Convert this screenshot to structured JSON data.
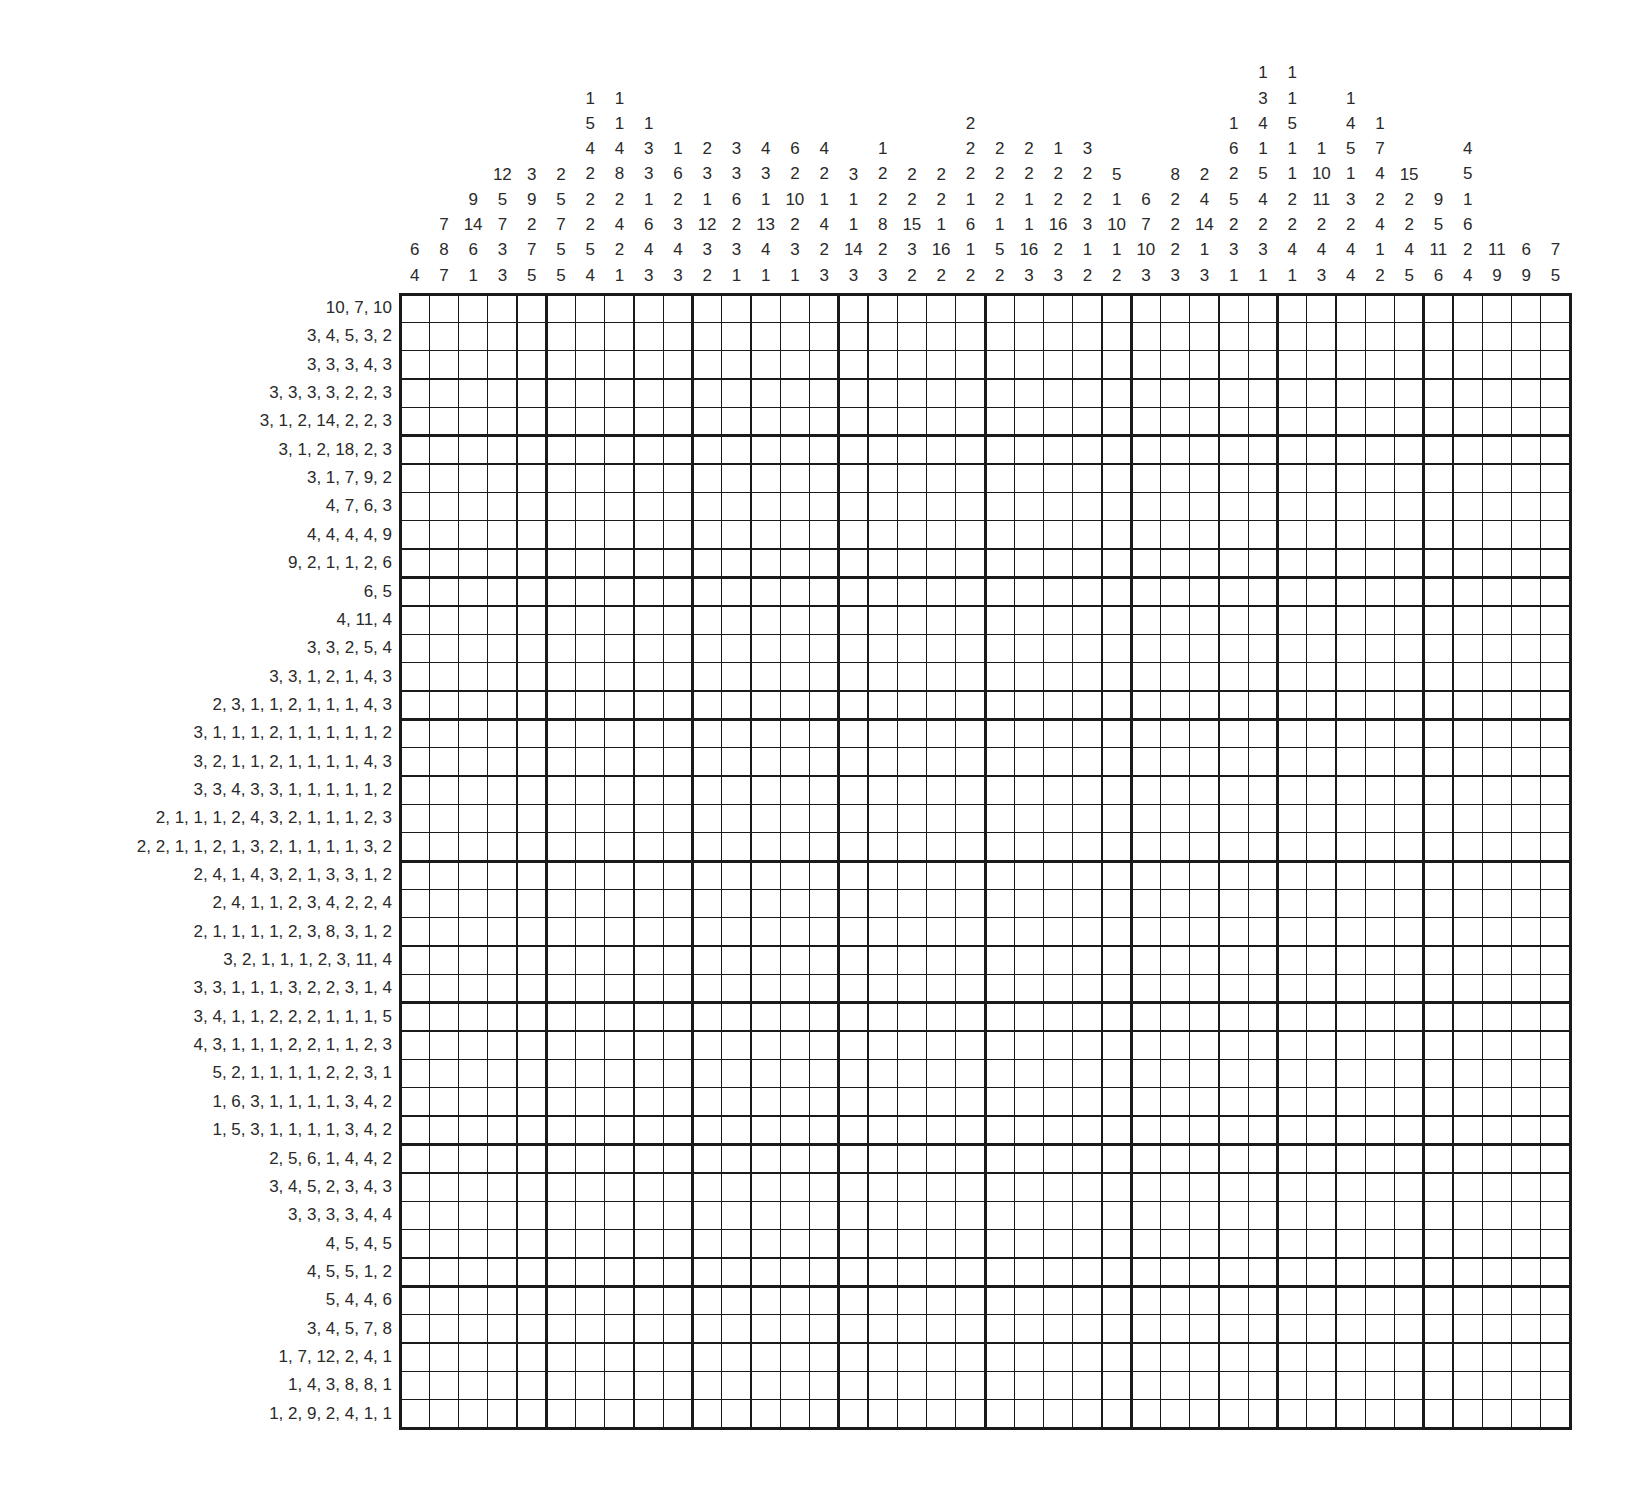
{
  "puzzle": {
    "type": "nonogram",
    "rows": 40,
    "cols": 40,
    "thick_every": 5,
    "colors": {
      "line": "#1a1a1a",
      "text": "#2a2a2a",
      "background": "#ffffff"
    },
    "column_clues": [
      [
        6,
        4
      ],
      [
        7,
        8,
        7
      ],
      [
        9,
        14,
        6,
        1
      ],
      [
        12,
        5,
        7,
        3,
        3
      ],
      [
        3,
        9,
        2,
        7,
        5
      ],
      [
        2,
        5,
        7,
        5,
        5
      ],
      [
        1,
        5,
        4,
        2,
        2,
        2,
        5,
        4
      ],
      [
        1,
        1,
        4,
        8,
        2,
        4,
        2,
        1
      ],
      [
        1,
        3,
        3,
        1,
        6,
        4,
        3
      ],
      [
        1,
        6,
        2,
        3,
        4,
        3
      ],
      [
        2,
        3,
        1,
        12,
        3,
        2
      ],
      [
        3,
        3,
        6,
        2,
        3,
        1
      ],
      [
        4,
        3,
        1,
        13,
        4,
        1
      ],
      [
        6,
        2,
        10,
        2,
        3,
        1
      ],
      [
        4,
        2,
        1,
        4,
        2,
        3
      ],
      [
        3,
        1,
        1,
        14,
        3
      ],
      [
        1,
        2,
        2,
        8,
        2,
        3
      ],
      [
        2,
        2,
        15,
        3,
        2
      ],
      [
        2,
        2,
        1,
        16,
        2
      ],
      [
        2,
        2,
        2,
        1,
        6,
        1,
        2
      ],
      [
        2,
        2,
        2,
        1,
        5,
        2
      ],
      [
        2,
        2,
        1,
        1,
        16,
        3
      ],
      [
        1,
        2,
        2,
        16,
        2,
        3
      ],
      [
        3,
        2,
        2,
        3,
        1,
        2
      ],
      [
        5,
        1,
        10,
        1,
        2
      ],
      [
        6,
        7,
        10,
        3
      ],
      [
        8,
        2,
        2,
        2,
        3
      ],
      [
        2,
        4,
        14,
        1,
        3
      ],
      [
        1,
        6,
        2,
        5,
        2,
        3,
        1
      ],
      [
        1,
        3,
        4,
        1,
        5,
        4,
        2,
        3,
        1
      ],
      [
        1,
        1,
        5,
        1,
        1,
        2,
        2,
        4,
        1
      ],
      [
        1,
        10,
        11,
        2,
        4,
        3
      ],
      [
        1,
        4,
        5,
        1,
        3,
        2,
        4,
        4
      ],
      [
        1,
        7,
        4,
        2,
        4,
        1,
        2
      ],
      [
        15,
        2,
        2,
        4,
        5
      ],
      [
        9,
        5,
        11,
        6
      ],
      [
        4,
        5,
        1,
        6,
        2,
        4
      ],
      [
        11,
        9
      ],
      [
        6,
        9
      ],
      [
        7,
        5
      ]
    ],
    "row_clues": [
      "10, 7, 10",
      "3, 4, 5, 3, 2",
      "3, 3, 3, 4, 3",
      "3, 3, 3, 3, 2, 2, 3",
      "3, 1, 2, 14, 2, 2, 3",
      "3, 1, 2, 18, 2, 3",
      "3, 1, 7, 9, 2",
      "4, 7, 6, 3",
      "4, 4, 4, 4, 9",
      "9, 2, 1, 1, 2, 6",
      "6, 5",
      "4, 11, 4",
      "3, 3, 2, 5, 4",
      "3, 3, 1, 2, 1, 4, 3",
      "2, 3, 1, 1, 2, 1, 1, 1, 4, 3",
      "3, 1, 1, 1, 2, 1, 1, 1, 1, 1, 2",
      "3, 2, 1, 1, 2, 1, 1, 1, 1, 4, 3",
      "3, 3, 4, 3, 3, 1, 1, 1, 1, 1, 2",
      "2, 1, 1, 1, 2, 4, 3, 2, 1, 1, 1, 2, 3",
      "2, 2, 1, 1, 2, 1, 3, 2, 1, 1, 1, 1, 3, 2",
      "2, 4, 1, 4, 3, 2, 1, 3, 3, 1, 2",
      "2, 4, 1, 1, 2, 3, 4, 2, 2, 4",
      "2, 1, 1, 1, 1, 2, 3, 8, 3, 1, 2",
      "3, 2, 1, 1, 1, 2, 3, 11, 4",
      "3, 3, 1, 1, 1, 3, 2, 2, 3, 1, 4",
      "3, 4, 1, 1, 2, 2, 2, 1, 1, 1, 5",
      "4, 3, 1, 1, 1, 2, 2, 1, 1, 2, 3",
      "5, 2, 1, 1, 1, 1, 2, 2, 3, 1",
      "1, 6, 3, 1, 1, 1, 1, 3, 4, 2",
      "1, 5, 3, 1, 1, 1, 1, 3, 4, 2",
      "2, 5, 6, 1, 4, 4, 2",
      "3, 4, 5, 2, 3, 4, 3",
      "3, 3, 3, 3, 4, 4",
      "4, 5, 4, 5",
      "4, 5, 5, 1, 2",
      "5, 4, 4, 6",
      "3, 4, 5, 7, 8",
      "1, 7, 12, 2, 4, 1",
      "1, 4, 3, 8, 8, 1",
      "1, 2, 9, 2, 4, 1, 1"
    ]
  }
}
